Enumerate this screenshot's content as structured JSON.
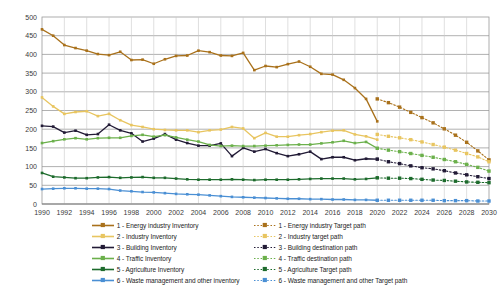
{
  "chart_data": {
    "type": "line",
    "title": "",
    "xlabel": "",
    "ylabel": "",
    "xlim": [
      1990,
      2030
    ],
    "ylim": [
      0,
      500
    ],
    "ytick_step": 50,
    "xtick_step": 2,
    "grid": true,
    "legend_position": "bottom",
    "yticks": [
      "0",
      "50",
      "100",
      "150",
      "200",
      "250",
      "300",
      "350",
      "400",
      "450",
      "500"
    ],
    "xticks": [
      "1990",
      "1992",
      "1994",
      "1996",
      "1998",
      "2000",
      "2002",
      "2004",
      "2006",
      "2008",
      "2010",
      "2012",
      "2014",
      "2016",
      "2018",
      "2020",
      "2022",
      "2024",
      "2026",
      "2028",
      "2030"
    ],
    "x_inventory": [
      1990,
      1991,
      1992,
      1993,
      1994,
      1995,
      1996,
      1997,
      1998,
      1999,
      2000,
      2001,
      2002,
      2003,
      2004,
      2005,
      2006,
      2007,
      2008,
      2009,
      2010,
      2011,
      2012,
      2013,
      2014,
      2015,
      2016,
      2017,
      2018,
      2019,
      2020
    ],
    "x_target": [
      2020,
      2021,
      2022,
      2023,
      2024,
      2025,
      2026,
      2027,
      2028,
      2029,
      2030
    ],
    "series": [
      {
        "name": "1 - Energy industry Inventory",
        "target_name": "1 - Energy industry Target path",
        "color": "#a9711b",
        "target_color": "#a9711b",
        "values": [
          467,
          450,
          425,
          417,
          410,
          401,
          398,
          407,
          385,
          386,
          375,
          387,
          396,
          397,
          410,
          406,
          397,
          396,
          404,
          358,
          369,
          366,
          374,
          381,
          367,
          348,
          346,
          332,
          310,
          281,
          221
        ],
        "target_values": [
          281,
          271,
          259,
          245,
          231,
          217,
          201,
          184,
          165,
          142,
          118
        ]
      },
      {
        "name": "2 - Industry Inventory",
        "target_name": "2 - Industry target path",
        "color": "#e8c560",
        "target_color": "#e8c560",
        "values": [
          285,
          261,
          241,
          246,
          248,
          235,
          241,
          224,
          211,
          206,
          200,
          198,
          197,
          197,
          192,
          197,
          199,
          206,
          202,
          176,
          190,
          180,
          180,
          184,
          187,
          192,
          196,
          197,
          186,
          181,
          172
        ],
        "target_values": [
          186,
          181,
          177,
          172,
          166,
          159,
          152,
          144,
          135,
          126,
          113
        ]
      },
      {
        "name": "3 - Building Inventory",
        "target_name": "3 - Building destination path",
        "color": "#221b36",
        "target_color": "#221b36",
        "values": [
          209,
          207,
          191,
          196,
          185,
          187,
          212,
          197,
          189,
          167,
          175,
          187,
          172,
          163,
          156,
          156,
          162,
          128,
          150,
          140,
          147,
          136,
          128,
          133,
          140,
          120,
          125,
          125,
          117,
          121,
          120
        ],
        "target_values": [
          120,
          113,
          108,
          102,
          97,
          94,
          89,
          83,
          78,
          73,
          68
        ]
      },
      {
        "name": "4 - Traffic Inventory",
        "target_name": "4 - Traffic destination path",
        "color": "#6bb04b",
        "target_color": "#6bb04b",
        "values": [
          163,
          168,
          173,
          176,
          173,
          176,
          177,
          177,
          182,
          185,
          180,
          184,
          178,
          172,
          167,
          158,
          155,
          156,
          155,
          155,
          156,
          157,
          158,
          159,
          159,
          162,
          165,
          169,
          163,
          166,
          149
        ],
        "target_values": [
          149,
          144,
          140,
          135,
          130,
          125,
          119,
          113,
          106,
          98,
          88
        ]
      },
      {
        "name": "5 - Agriculture Inventory",
        "target_name": "5 - Agriculture Target path",
        "color": "#1d6b2c",
        "target_color": "#1d6b2c",
        "values": [
          83,
          73,
          71,
          69,
          69,
          71,
          72,
          70,
          71,
          72,
          70,
          70,
          68,
          66,
          65,
          65,
          65,
          66,
          65,
          64,
          65,
          65,
          65,
          66,
          67,
          68,
          68,
          68,
          66,
          67,
          70
        ],
        "target_values": [
          70,
          69,
          69,
          68,
          66,
          64,
          63,
          61,
          59,
          58,
          57
        ]
      },
      {
        "name": "6 - Waste management and other inventory",
        "target_name": "6 - Waste management and other Target path",
        "color": "#4a8fd4",
        "target_color": "#4a8fd4",
        "values": [
          40,
          41,
          42,
          42,
          41,
          41,
          40,
          36,
          34,
          32,
          31,
          29,
          27,
          26,
          25,
          23,
          21,
          19,
          18,
          17,
          16,
          15,
          14,
          14,
          13,
          13,
          12,
          12,
          11,
          11,
          10
        ],
        "target_values": [
          10,
          10,
          10,
          10,
          10,
          10,
          9,
          9,
          9,
          8,
          8
        ]
      }
    ]
  },
  "legend": {
    "left_column": [
      "1 - Energy industry Inventory",
      "2 - Industry Inventory",
      "3 - Building Inventory",
      "4 - Traffic Inventory",
      "5 - Agriculture Inventory",
      "6 - Waste management and other inventory"
    ],
    "right_column": [
      "1 - Energy industry Target path",
      "2 - Industry target path",
      "3 - Building destination path",
      "4 - Traffic destination path",
      "5 - Agriculture Target path",
      "6 - Waste management and other Target path"
    ]
  }
}
